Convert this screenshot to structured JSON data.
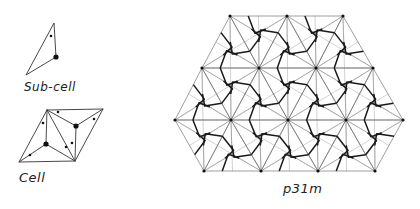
{
  "labels": {
    "subcell": "Sub-cell",
    "cell": "Cell",
    "group": "p31m"
  },
  "subcell": {
    "triangle": [
      [
        54,
        23
      ],
      [
        56,
        57
      ],
      [
        26,
        75
      ]
    ],
    "big_dot": [
      56,
      57
    ],
    "small_dots": [
      [
        51,
        36
      ]
    ]
  },
  "cell": {
    "rhombus": [
      [
        47,
        110
      ],
      [
        103,
        109
      ],
      [
        75,
        161
      ],
      [
        19,
        162
      ]
    ],
    "big_dots": [
      [
        46,
        144
      ],
      [
        76,
        126
      ]
    ],
    "small_dots": [
      [
        58,
        112
      ],
      [
        43,
        123
      ],
      [
        30,
        155
      ],
      [
        66,
        147
      ],
      [
        72,
        143
      ],
      [
        94,
        119
      ]
    ]
  },
  "pattern": {
    "rows": [
      {
        "y": 16,
        "xs": [
          230,
          287,
          343
        ]
      },
      {
        "y": 68,
        "xs": [
          202,
          259,
          316,
          373
        ]
      },
      {
        "y": 120,
        "xs": [
          175,
          231,
          288,
          346,
          403
        ]
      },
      {
        "y": 171,
        "xs": [
          204,
          261,
          318,
          375
        ]
      }
    ]
  },
  "colors": {
    "thin": "#777777",
    "thick": "#1a1a1a",
    "dot": "#111111"
  }
}
